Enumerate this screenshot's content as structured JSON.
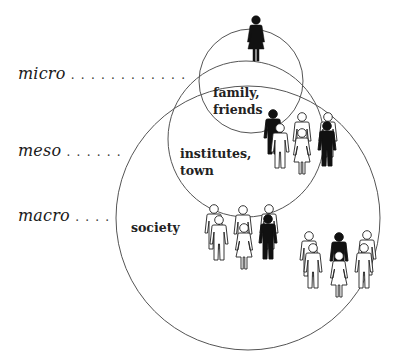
{
  "levels": [
    {
      "name": "micro",
      "dots": ". . . . . . . . . . . ."
    },
    {
      "name": "meso",
      "dots": ". . . . . ."
    },
    {
      "name": "macro",
      "dots": ". . . ."
    }
  ],
  "circles": [
    {
      "label": "family,\nfriends",
      "level": "micro"
    },
    {
      "label": "institutes,\ntown",
      "level": "meso"
    },
    {
      "label": "society",
      "level": "macro"
    }
  ],
  "colors": {
    "line": "#555555",
    "figure_dark": "#111111",
    "figure_light": "#ffffff"
  }
}
